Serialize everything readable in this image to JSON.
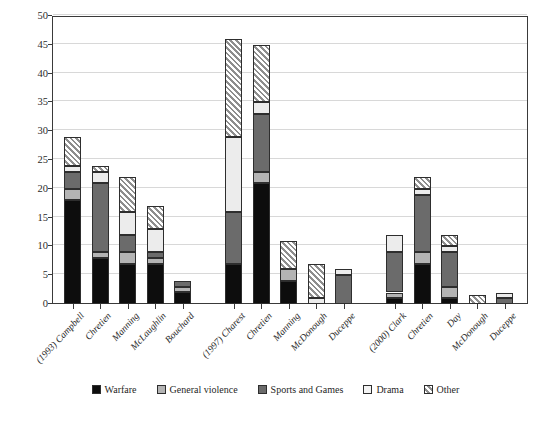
{
  "chart_data": {
    "type": "bar",
    "title": "",
    "subtitle": "",
    "xlabel": "",
    "ylabel": "",
    "ylim": [
      0,
      50
    ],
    "ytick_step": 5,
    "yticks": [
      0,
      5,
      10,
      15,
      20,
      25,
      30,
      35,
      40,
      45,
      50
    ],
    "grid": true,
    "stacked": true,
    "legend_position": "bottom",
    "categories": [
      "(1993) Campbell",
      "Chretien",
      "Manning",
      "McLaughlin",
      "Bouchard",
      "(1997) Charest",
      "Chretien",
      "Manning",
      "McDonough",
      "Duceppe",
      "(2000) Clark",
      "Chretien",
      "Day",
      "McDonough",
      "Duceppe"
    ],
    "group_gaps_after": [
      4,
      9
    ],
    "series": [
      {
        "name": "Warfare",
        "color": "#0d0d0d",
        "pattern": "solid",
        "values": [
          18,
          8,
          7,
          7,
          2,
          7,
          21,
          4,
          0,
          0,
          1,
          7,
          1,
          0,
          0
        ]
      },
      {
        "name": "General violence",
        "color": "#b4b4b4",
        "pattern": "solid",
        "values": [
          2,
          1,
          2,
          1,
          1,
          0,
          2,
          2,
          0,
          0,
          1,
          2,
          2,
          0,
          0
        ]
      },
      {
        "name": "Sports and Games",
        "color": "#6b6b6b",
        "pattern": "solid",
        "values": [
          3,
          12,
          3,
          1,
          1,
          9,
          10,
          0,
          0,
          5,
          7,
          10,
          6,
          0,
          1
        ]
      },
      {
        "name": "Drama",
        "color": "#ececec",
        "pattern": "solid",
        "values": [
          1,
          2,
          4,
          4,
          0,
          13,
          2,
          0,
          1,
          1,
          3,
          1,
          1,
          0,
          1
        ]
      },
      {
        "name": "Other",
        "color": "#c9c9c9",
        "pattern": "diagonal-hatch",
        "values": [
          5,
          1,
          6,
          4,
          0,
          17,
          10,
          5,
          6,
          0,
          0,
          2,
          2,
          1.5,
          0
        ]
      }
    ],
    "totals": [
      29,
      24,
      22,
      17,
      4,
      46,
      45,
      11,
      7,
      6,
      12,
      22,
      12,
      1.5,
      2
    ]
  },
  "legend": {
    "items": [
      {
        "label": "Warfare",
        "key": "warfare"
      },
      {
        "label": "General violence",
        "key": "general"
      },
      {
        "label": "Sports and Games",
        "key": "sports"
      },
      {
        "label": "Drama",
        "key": "drama"
      },
      {
        "label": "Other",
        "key": "other"
      }
    ]
  },
  "caption": {
    "text": ""
  }
}
